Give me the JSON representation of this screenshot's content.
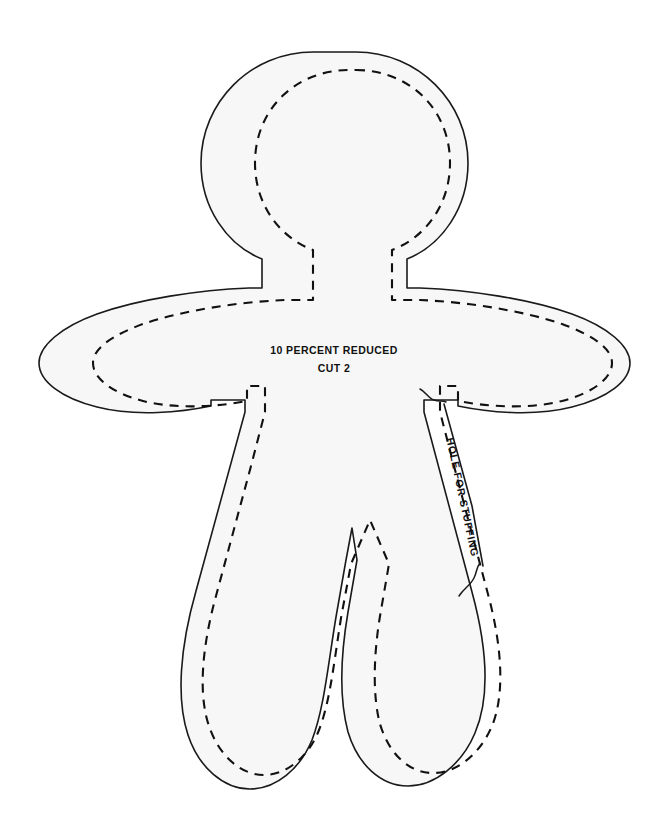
{
  "page": {
    "title": "TEMPLATES—Fabric Painting",
    "section_label": "DOLL",
    "background_color": "#ffffff"
  },
  "pattern": {
    "name": "doll-body-template",
    "fill_color": "#f7f7f7",
    "outline_color": "#1a1a1a",
    "seam_line_color": "#111111",
    "annotations": {
      "scale_note": "10 PERCENT REDUCED",
      "cut_note": "CUT 2",
      "stuffing_note": "HOLE FOR STUFFING"
    }
  }
}
